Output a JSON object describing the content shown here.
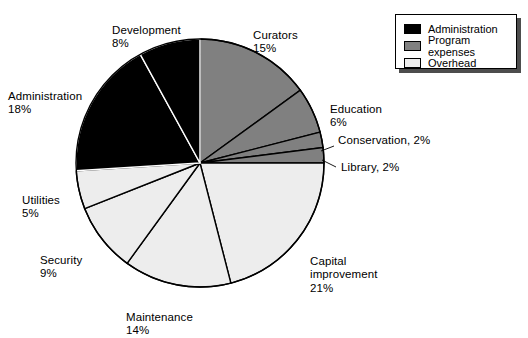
{
  "chart_data": {
    "type": "pie",
    "title": "",
    "xlabel": "",
    "ylabel": "",
    "total": 100,
    "units": "%",
    "start_angle_deg": 0,
    "direction": "clockwise",
    "categories": [
      "Curators",
      "Education",
      "Conservation",
      "Library",
      "Capital improvement",
      "Maintenance",
      "Security",
      "Utilities",
      "Administration",
      "Development"
    ],
    "values": [
      15,
      6,
      2,
      2,
      21,
      14,
      9,
      5,
      18,
      8
    ],
    "slices": [
      {
        "label": "Curators",
        "value": 15,
        "pct_text": "15%",
        "group": "Program expenses",
        "color": "#808080"
      },
      {
        "label": "Education",
        "value": 6,
        "pct_text": "6%",
        "group": "Program expenses",
        "color": "#808080"
      },
      {
        "label": "Conservation",
        "value": 2,
        "pct_text": "2%",
        "group": "Program expenses",
        "color": "#808080"
      },
      {
        "label": "Library",
        "value": 2,
        "pct_text": "2%",
        "group": "Program expenses",
        "color": "#808080"
      },
      {
        "label": "Capital improvement",
        "value": 21,
        "pct_text": "21%",
        "group": "Overhead",
        "color": "#ededed"
      },
      {
        "label": "Maintenance",
        "value": 14,
        "pct_text": "14%",
        "group": "Overhead",
        "color": "#ededed"
      },
      {
        "label": "Security",
        "value": 9,
        "pct_text": "9%",
        "group": "Overhead",
        "color": "#ededed"
      },
      {
        "label": "Utilities",
        "value": 5,
        "pct_text": "5%",
        "group": "Overhead",
        "color": "#ededed"
      },
      {
        "label": "Administration",
        "value": 18,
        "pct_text": "18%",
        "group": "Administration",
        "color": "#000000"
      },
      {
        "label": "Development",
        "value": 8,
        "pct_text": "8%",
        "group": "Administration",
        "color": "#000000"
      }
    ],
    "legend": {
      "position": "top-right",
      "entries": [
        {
          "label": "Administration",
          "color": "#000000"
        },
        {
          "label": "Program expenses",
          "color": "#808080"
        },
        {
          "label": "Overhead",
          "color": "#ededed"
        }
      ]
    },
    "grid": false
  },
  "labels": {
    "development": {
      "name": "Development",
      "pct": "8%"
    },
    "curators": {
      "name": "Curators",
      "pct": "15%"
    },
    "administration": {
      "name": "Administration",
      "pct": "18%"
    },
    "education": {
      "name": "Education",
      "pct": "6%"
    },
    "conservation": {
      "text": "Conservation, 2%"
    },
    "library": {
      "text": "Library, 2%"
    },
    "utilities": {
      "name": "Utilities",
      "pct": "5%"
    },
    "security": {
      "name": "Security",
      "pct": "9%"
    },
    "maintenance": {
      "name": "Maintenance",
      "pct": "14%"
    },
    "capital": {
      "name": "Capital\nimprovement",
      "pct": "21%"
    }
  }
}
